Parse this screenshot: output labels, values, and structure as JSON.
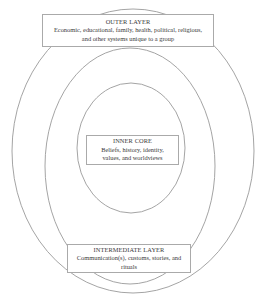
{
  "diagram": {
    "type": "concentric-layers",
    "stroke_color": "#9a9a9a",
    "outer_layer": {
      "title": "OUTER LAYER",
      "line1": "Economic, educational, family, health, political, religious,",
      "line2": "and other systems unique to a group"
    },
    "inner_core": {
      "title": "INNER CORE",
      "line1": "Beliefs, history, identity,",
      "line2": "values, and worldviews"
    },
    "intermediate_layer": {
      "title": "INTERMEDIATE LAYER",
      "line1": "Communication(s), customs, stories, and",
      "line2": "rituals"
    }
  }
}
